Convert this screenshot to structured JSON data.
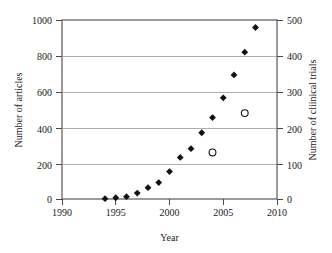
{
  "chart_data": {
    "type": "scatter",
    "title": "",
    "xlabel": "Year",
    "ylabel": "Number of articles",
    "y2label": "Number of cliinical trials",
    "xlim": [
      1990,
      2010
    ],
    "ylim": [
      0,
      1000
    ],
    "y2lim": [
      0,
      500
    ],
    "grid": true,
    "legend": "none",
    "xticks": [
      "1990",
      "1995",
      "2000",
      "2005",
      "2010"
    ],
    "yticks": [
      "0",
      "200",
      "400",
      "600",
      "800",
      "1000"
    ],
    "y2ticks": [
      "0",
      "100",
      "200",
      "300",
      "400",
      "500"
    ],
    "series": [
      {
        "name": "Number of articles",
        "axis": "left",
        "marker": "filled-diamond",
        "color": "#111111",
        "x": [
          1994,
          1995,
          1996,
          1997,
          1998,
          1999,
          2000,
          2001,
          2002,
          2003,
          2004,
          2005,
          2006,
          2007,
          2008
        ],
        "values": [
          2,
          7,
          13,
          33,
          63,
          92,
          153,
          232,
          281,
          370,
          455,
          565,
          693,
          820,
          958
        ]
      },
      {
        "name": "Number of cliinical trials",
        "axis": "right",
        "marker": "open-circle",
        "color": "#111111",
        "x": [
          2004,
          2007
        ],
        "values": [
          130,
          240
        ]
      }
    ]
  },
  "axes": {
    "x_title": "Year",
    "y_left_title": "Number of articles",
    "y_right_title": "Number of cliinical trials"
  }
}
